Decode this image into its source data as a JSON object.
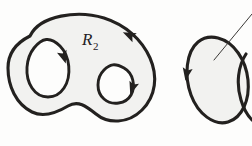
{
  "figure": {
    "background_color": "#fdfdfc",
    "ink_color": "#23211f",
    "region_fill_color": "#f2f2f0",
    "labels": [
      {
        "id": "region-label",
        "base": "R",
        "subscript": "2",
        "x": 82,
        "y": 45
      }
    ],
    "shapes": [
      {
        "name": "outer-region-boundary",
        "kind": "closed-blob",
        "orientation": "counterclockwise",
        "arrow_count": 1
      },
      {
        "name": "left-hole-boundary",
        "kind": "tilted-ellipse",
        "orientation": "clockwise",
        "arrow_count": 1
      },
      {
        "name": "right-hole-boundary",
        "kind": "tilted-ellipse",
        "orientation": "clockwise",
        "arrow_count": 1
      },
      {
        "name": "secondary-oval",
        "kind": "oval",
        "orientation": "clockwise",
        "arrow_count": 1,
        "has_leader_line": true
      },
      {
        "name": "clipped-edge-arc",
        "kind": "partial-arc",
        "orientation": "unknown",
        "arrow_count": 0
      }
    ]
  },
  "geometry": {
    "outer_blob_path": "M 30 36 C 40 15, 78 10, 104 18 C 126 25, 142 40, 150 58 C 158 76, 156 96, 142 110 C 128 124, 108 124, 96 114 C 86 106, 78 100, 68 106 C 58 112, 44 118, 32 112 C 16 104, 8 86, 8 68 C 8 52, 18 42, 30 36 Z",
    "left_hole_path": "M 34 48 C 26 58, 24 76, 32 88 C 40 100, 56 100, 64 88 C 72 76, 70 56, 60 46 C 50 36, 42 38, 34 48 Z",
    "right_hole_path": "M 104 70 C 96 78, 96 92, 104 99 C 112 106, 126 104, 131 95 C 136 86, 133 73, 124 68 C 115 63, 110 64, 104 70 Z",
    "secondary_oval_path": "M 198 42 C 186 52, 184 76, 191 95 C 198 114, 214 126, 228 122 C 242 118, 250 100, 248 80 C 246 60, 234 42, 218 38 C 210 36, 203 38, 198 42 Z",
    "clipped_arc_path": "M 246 54 C 238 66, 236 84, 241 100 C 244 110, 248 116, 252 120",
    "leader_line": {
      "x1": 214,
      "y1": 60,
      "x2": 252,
      "y2": 14
    },
    "arrows": [
      {
        "name": "outer-arrow",
        "x": 131,
        "y": 36,
        "angle": 205
      },
      {
        "name": "left-hole-arrow",
        "x": 63,
        "y": 55,
        "angle": 72
      },
      {
        "name": "right-hole-arrow",
        "x": 133,
        "y": 86,
        "angle": 108
      },
      {
        "name": "secondary-oval-arrow",
        "x": 187,
        "y": 72,
        "angle": 100
      }
    ]
  }
}
